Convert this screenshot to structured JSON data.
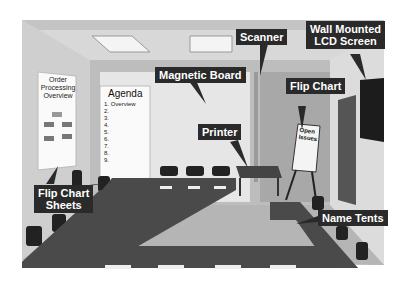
{
  "scene": {
    "description": "Conference room layout illustration",
    "labels": {
      "magnetic_board": "Magnetic Board",
      "scanner": "Scanner",
      "wall_lcd": [
        "Wall Mounted",
        "LCD Screen"
      ],
      "flip_chart": "Flip Chart",
      "printer": "Printer",
      "flip_chart_sheets": [
        "Flip Chart",
        "Sheets"
      ],
      "name_tents": "Name Tents"
    },
    "order_sheet": {
      "title": [
        "Order",
        "Processing",
        "Overview"
      ]
    },
    "agenda": {
      "title": "Agenda",
      "items": [
        "1. Overview",
        "2.",
        "3.",
        "4.",
        "5.",
        "6.",
        "7.",
        "8.",
        "9."
      ]
    },
    "flip_chart_pad": [
      "Open",
      "Issues"
    ]
  }
}
